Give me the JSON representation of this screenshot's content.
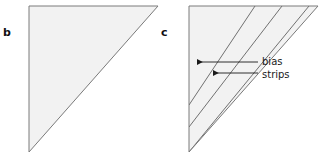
{
  "figure": {
    "background_color": "#ffffff",
    "width": 321,
    "height": 155,
    "panels": [
      {
        "id": "b",
        "label": "b",
        "shape": "right-triangle",
        "fill_color": "#f2f2f2",
        "stroke_color": "#7a7a7a",
        "vertices": [
          [
            29,
            6
          ],
          [
            158,
            6
          ],
          [
            29,
            152
          ]
        ],
        "strips": []
      },
      {
        "id": "c",
        "label": "c",
        "shape": "right-triangle",
        "fill_color": "#f2f2f2",
        "stroke_color": "#7a7a7a",
        "vertices": [
          [
            189,
            6
          ],
          [
            318,
            6
          ],
          [
            189,
            152
          ]
        ],
        "strips": [
          {
            "name": "bias-strip-line-1",
            "x1": 189,
            "y1": 105,
            "x2": 255,
            "y2": 6
          },
          {
            "name": "bias-strip-line-2",
            "x1": 189,
            "y1": 127,
            "x2": 282,
            "y2": 6
          },
          {
            "name": "bias-strip-line-3",
            "x1": 189,
            "y1": 152,
            "x2": 309,
            "y2": 6
          }
        ]
      }
    ],
    "callouts": [
      {
        "id": "bias",
        "text": "bias",
        "arrow": {
          "from_x": 258,
          "from_y": 62,
          "to_x": 196,
          "to_y": 62
        }
      },
      {
        "id": "strips",
        "text": "strips",
        "arrow": {
          "from_x": 258,
          "from_y": 73,
          "to_x": 212,
          "to_y": 73
        }
      }
    ],
    "colors": {
      "triangle_fill": "#f2f2f2",
      "triangle_stroke": "#7a7a7a",
      "strip_stroke": "#707070",
      "arrow_stroke": "#1a1a1a",
      "text": "#1a1a1a"
    }
  }
}
